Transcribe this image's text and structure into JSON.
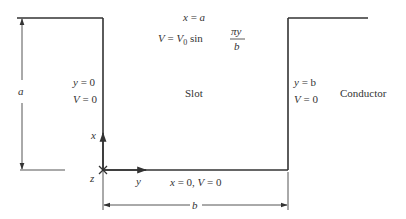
{
  "diagram": {
    "type": "slot-boundary-value-problem",
    "colors": {
      "line": "#333333",
      "dimension": "#555555",
      "text": "#333333",
      "background": "#ffffff"
    },
    "top_equation": {
      "line1": {
        "lhs": "x",
        "eq": " = ",
        "rhs": "a"
      },
      "line2": {
        "lhs": "V",
        "eq": " = ",
        "v": "V",
        "sub": "0",
        "func": " sin ",
        "num": "πy",
        "den": "b"
      }
    },
    "left_wall_label": {
      "line1_var": "y",
      "line1_rest": " = 0",
      "line2_var": "V",
      "line2_rest": " = 0"
    },
    "right_wall_label": {
      "line1_var": "y",
      "line1_rest": " = b",
      "line2_var": "V",
      "line2_rest": " = 0"
    },
    "center_label": "Slot",
    "conductor_label": "Conductor",
    "bottom_label": {
      "x": "x",
      "part1": " = 0, ",
      "v": "V",
      "part2": " = 0"
    },
    "axes": {
      "x_axis": "x",
      "y_axis": "y",
      "z_axis": "z"
    },
    "dimensions": {
      "height": "a",
      "width": "b"
    }
  }
}
